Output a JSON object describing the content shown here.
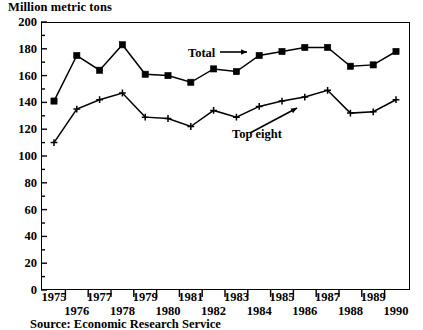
{
  "chart_data": {
    "type": "line",
    "title": "Million metric tons",
    "xlabel": "",
    "ylabel": "Million metric tons",
    "ylim": [
      0,
      200
    ],
    "ytick_step": 20,
    "yminor_step": 10,
    "grid": false,
    "legend_position": "inline-annotations",
    "x": [
      1975,
      1976,
      1977,
      1978,
      1979,
      1980,
      1981,
      1982,
      1983,
      1984,
      1985,
      1986,
      1987,
      1988,
      1989,
      1990
    ],
    "categories": [
      "1975",
      "1976",
      "1977",
      "1978",
      "1979",
      "1980",
      "1981",
      "1982",
      "1983",
      "1984",
      "1985",
      "1986",
      "1987",
      "1988",
      "1989",
      "1990"
    ],
    "series": [
      {
        "name": "Total",
        "marker": "filled-square",
        "values": [
          141,
          175,
          164,
          183,
          161,
          160,
          155,
          165,
          163,
          175,
          178,
          181,
          181,
          167,
          168,
          178
        ]
      },
      {
        "name": "Top eight",
        "marker": "plus",
        "values": [
          110,
          135,
          142,
          147,
          129,
          128,
          122,
          134,
          129,
          137,
          141,
          144,
          149,
          132,
          133,
          142
        ]
      }
    ],
    "annotations": [
      {
        "text": "Total",
        "arrow": "right",
        "target_series": "Total"
      },
      {
        "text": "Top eight",
        "arrow": "up-right",
        "target_series": "Top eight"
      }
    ],
    "ytick_labels": [
      "0",
      "20",
      "40",
      "60",
      "80",
      "100",
      "120",
      "140",
      "160",
      "180",
      "200"
    ],
    "xtick_labels_top": [
      "1975",
      "1977",
      "1979",
      "1981",
      "1983",
      "1985",
      "1987",
      "1989"
    ],
    "xtick_labels_bottom": [
      "1976",
      "1978",
      "1980",
      "1982",
      "1984",
      "1986",
      "1988",
      "1990"
    ],
    "source": "Source: Economic Research Service",
    "colors": {
      "axis": "#000000",
      "series_total": "#000000",
      "series_top_eight": "#000000",
      "background": "#ffffff"
    }
  }
}
